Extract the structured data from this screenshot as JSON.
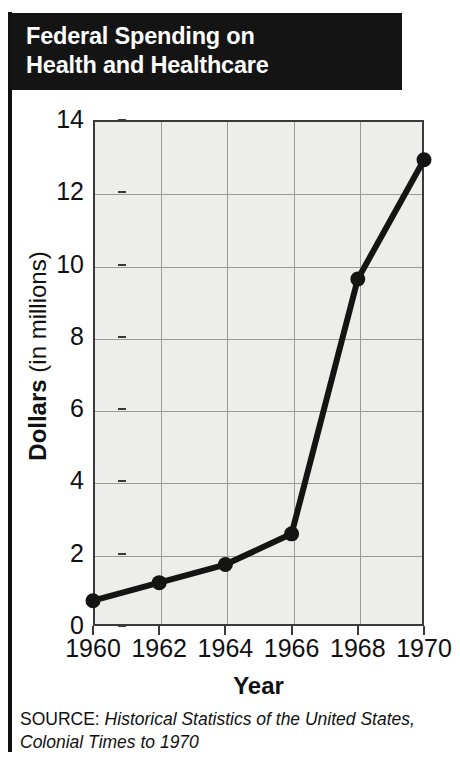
{
  "title": {
    "line1": "Federal Spending on",
    "line2": "Health and Healthcare"
  },
  "source": {
    "label": "SOURCE:",
    "citation": "Historical Statistics of the United States, Colonial Times to 1970"
  },
  "axis": {
    "y_title_strong": "Dollars",
    "y_title_rest": " (in millions)",
    "x_title": "Year"
  },
  "colors": {
    "banner_background": "#141414",
    "banner_text": "#ffffff",
    "plot_background": "#ededec",
    "plot_border": "#3a3a3a",
    "gridline": "#9a9a9a",
    "series_line": "#141414",
    "marker": "#141414",
    "page_background": "#ffffff"
  },
  "chart_data": {
    "type": "line",
    "title": "Federal Spending on Health and Healthcare",
    "xlabel": "Year",
    "ylabel": "Dollars (in millions)",
    "x": [
      1960,
      1962,
      1964,
      1966,
      1968,
      1970
    ],
    "values": [
      0.7,
      1.2,
      1.7,
      2.55,
      9.6,
      12.9
    ],
    "xtick_labels": [
      "1960",
      "1962",
      "1964",
      "1966",
      "1968",
      "1970"
    ],
    "ytick_labels": [
      "0",
      "2",
      "4",
      "6",
      "8",
      "10",
      "12",
      "14"
    ],
    "ytick_values": [
      0,
      2,
      4,
      6,
      8,
      10,
      12,
      14
    ],
    "xlim": [
      1960,
      1970
    ],
    "ylim": [
      0,
      14
    ],
    "grid": true,
    "legend": false,
    "markers": "filled-circle"
  }
}
